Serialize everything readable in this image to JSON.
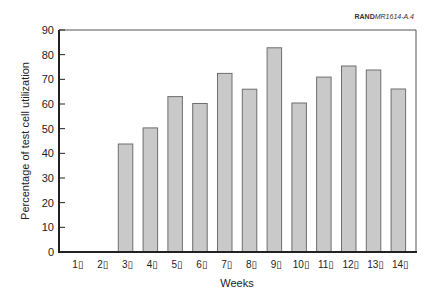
{
  "source_tag": {
    "prefix": "RAND",
    "suffix": "MR1614-A.4"
  },
  "chart_data": {
    "type": "bar",
    "title": "",
    "xlabel": "Weeks",
    "ylabel": "Percentage of test cell utilization",
    "categories": [
      "1▯",
      "2▯",
      "3▯",
      "4▯",
      "5▯",
      "6▯",
      "7▯",
      "8▯",
      "9▯",
      "10▯",
      "11▯",
      "12▯",
      "13▯",
      "14▯"
    ],
    "values": [
      0,
      0,
      43.8,
      50.3,
      63,
      60.2,
      72.4,
      66,
      82.8,
      60.4,
      70.9,
      75.4,
      73.8,
      66.1
    ],
    "ylim": [
      0,
      90
    ],
    "yticks": [
      0,
      10,
      20,
      30,
      40,
      50,
      60,
      70,
      80,
      90
    ],
    "grid": false,
    "legend": null,
    "colors": {
      "bar_fill": "#c9c9c9",
      "bar_stroke": "#6e6e6e",
      "axis": "#222222",
      "frame": "#555555",
      "text": "#222222"
    }
  }
}
